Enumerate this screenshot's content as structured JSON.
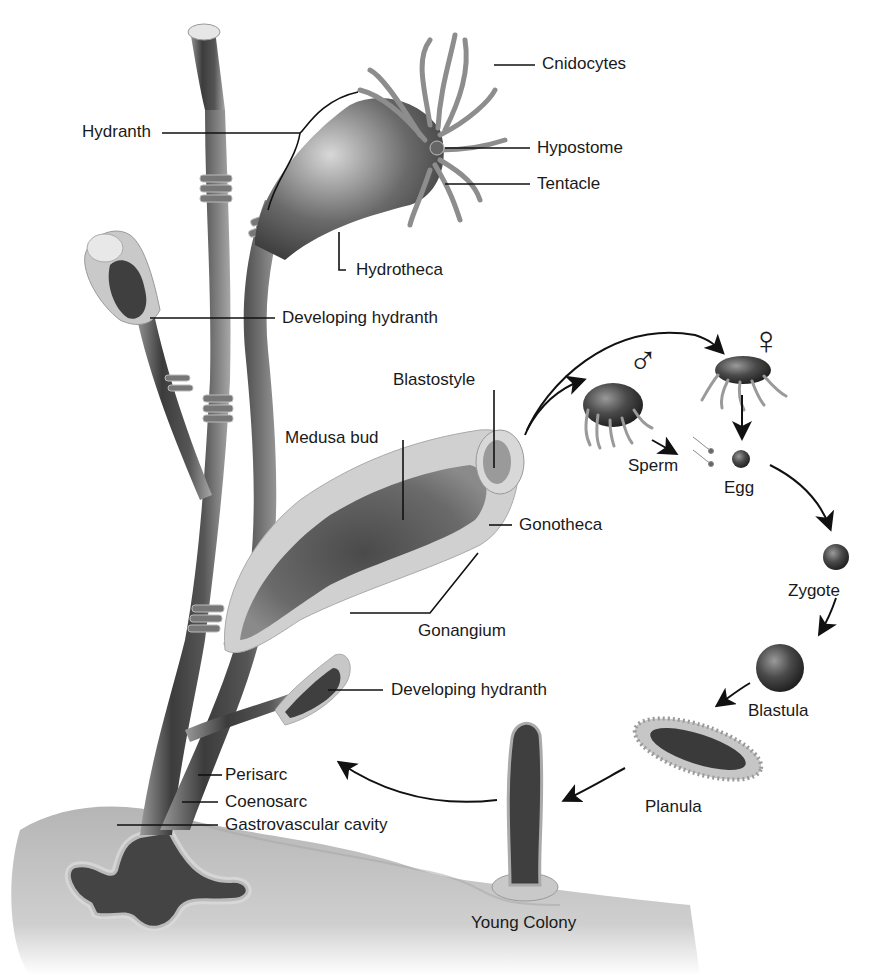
{
  "diagram": {
    "colors": {
      "background": "#ffffff",
      "substrate": "#bdbdbd",
      "stalk_dark": "#3a3a3a",
      "stalk_mid": "#6b6b6b",
      "perisarc": "#c8c8c8",
      "leader_lines": "#111111",
      "label_text": "#1a1a1a"
    },
    "labels": {
      "cnidocytes": "Cnidocytes",
      "hydranth": "Hydranth",
      "hypostome": "Hypostome",
      "tentacle": "Tentacle",
      "hydrotheca": "Hydrotheca",
      "developing_hydranth_top": "Developing hydranth",
      "blastostyle": "Blastostyle",
      "medusa_bud": "Medusa bud",
      "gonotheca": "Gonotheca",
      "gonangium": "Gonangium",
      "developing_hydranth_bottom": "Developing hydranth",
      "perisarc": "Perisarc",
      "coenosarc": "Coenosarc",
      "gastrovascular_cavity": "Gastrovascular cavity",
      "young_colony": "Young Colony"
    },
    "life_cycle": {
      "male_symbol": "♂",
      "female_symbol": "♀",
      "stages": [
        "Sperm",
        "Egg",
        "Zygote",
        "Blastula",
        "Planula",
        "Young Colony"
      ]
    }
  }
}
